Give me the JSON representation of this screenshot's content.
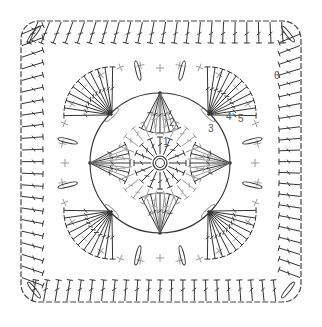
{
  "diagram": {
    "type": "crochet-chart",
    "colors": {
      "dark": "#333333",
      "light": "#9a9a9a",
      "frame": "#444444",
      "label": "#555555",
      "background": "#ffffff"
    },
    "center": {
      "symbol": "magic-ring"
    },
    "round_labels": [
      "1",
      "2",
      "3",
      "4",
      "5",
      "6"
    ],
    "stitch_legend": [
      {
        "symbol": "+",
        "name": "single crochet"
      },
      {
        "symbol": "T-bar",
        "name": "half double crochet"
      },
      {
        "symbol": "T-bar-slash",
        "name": "double crochet"
      },
      {
        "symbol": "oval",
        "name": "chain"
      },
      {
        "symbol": "dot",
        "name": "slip stitch"
      }
    ],
    "rounds": [
      {
        "round": 1,
        "stitch": "double crochet",
        "count": 16,
        "color": "dark"
      },
      {
        "round": 2,
        "stitch": "half double crochet",
        "count": 24,
        "color": "light"
      },
      {
        "round": 3,
        "stitch": "double crochet fans",
        "count": 8,
        "color": "dark"
      },
      {
        "round": 4,
        "stitch": "single crochet",
        "count": 32,
        "color": "light"
      },
      {
        "round": 5,
        "stitch": "double crochet",
        "count": 48,
        "color": "dark"
      },
      {
        "round": 6,
        "stitch": "double crochet border",
        "count": 88,
        "color": "dark"
      }
    ]
  }
}
